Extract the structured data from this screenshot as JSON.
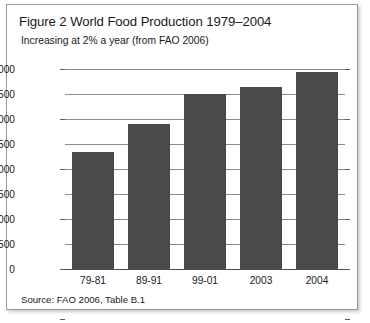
{
  "figure": {
    "title": "Figure 2 World Food Production 1979–2004",
    "subtitle": "Increasing at 2% a year (from FAO 2006)",
    "source": "Source: FAO 2006, Table B.1"
  },
  "colors": {
    "bar": "#4a4a4a",
    "gridline": "#8c8c8c",
    "border": "#9a9a9a",
    "text": "#1a1a1a"
  },
  "chart_data": {
    "type": "bar",
    "title": "Figure 2 World Food Production 1979–2004",
    "subtitle": "Increasing at 2% a year (from FAO 2006)",
    "categories": [
      "79-81",
      "89-91",
      "99-01",
      "2003",
      "2004"
    ],
    "values": [
      2350,
      2900,
      3500,
      3650,
      3950
    ],
    "xlabel": "",
    "ylabel": "Million metric tons of grain, veg., and meat",
    "ylim": [
      0,
      4000
    ],
    "ytick_labels": [
      "0",
      "500",
      "1000",
      "1500",
      "2000",
      "2500",
      "3000",
      "3500",
      "4000"
    ],
    "ytick_values": [
      0,
      500,
      1000,
      1500,
      2000,
      2500,
      3000,
      3500,
      4000
    ],
    "grid": true,
    "legend": false,
    "source": "Source: FAO 2006, Table B.1"
  }
}
